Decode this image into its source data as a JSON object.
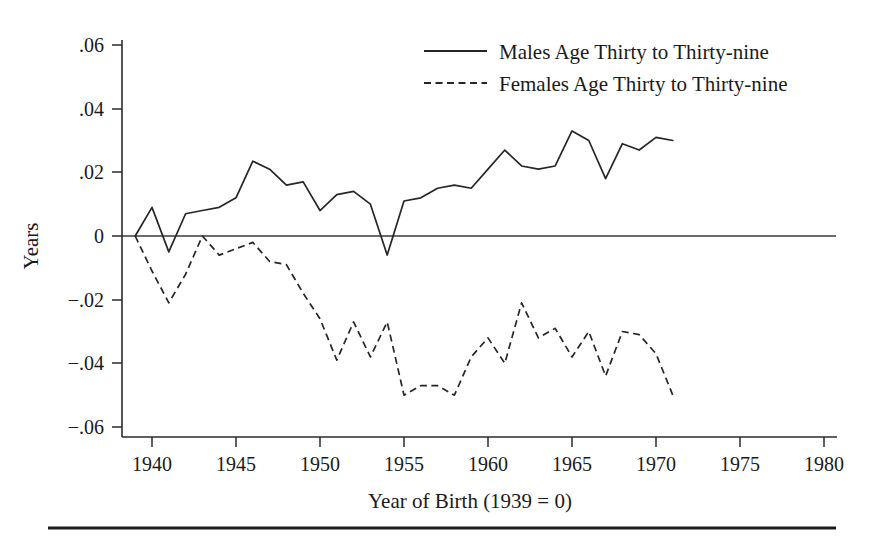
{
  "chart_data": {
    "type": "line",
    "title": "",
    "xlabel": "Year of Birth (1939 = 0)",
    "ylabel": "Years",
    "xlim": [
      1938.2,
      1981.0
    ],
    "ylim": [
      -0.06,
      0.06
    ],
    "xticks": [
      1940,
      1945,
      1950,
      1955,
      1960,
      1965,
      1970,
      1975,
      1980
    ],
    "xtick_labels": [
      "1940",
      "1945",
      "1950",
      "1955",
      "1960",
      "1965",
      "1970",
      "1975",
      "1980"
    ],
    "yticks": [
      0.06,
      0.04,
      0.02,
      0,
      -0.02,
      -0.04,
      -0.06
    ],
    "ytick_labels": [
      ".06",
      ".04",
      ".02",
      "0",
      "−.02",
      "−.04",
      "−.06"
    ],
    "grid": false,
    "legend_position": "top-center",
    "zero_reference_line": true,
    "series": [
      {
        "name": "Males Age Thirty to Thirty-nine",
        "style": "solid",
        "x": [
          1939,
          1940,
          1941,
          1942,
          1943,
          1944,
          1945,
          1946,
          1947,
          1948,
          1949,
          1950,
          1951,
          1952,
          1953,
          1954,
          1955,
          1956,
          1957,
          1958,
          1959,
          1960,
          1961,
          1962,
          1963,
          1964,
          1965,
          1966,
          1967,
          1968,
          1969,
          1970,
          1971
        ],
        "values": [
          0.0,
          0.009,
          -0.005,
          0.007,
          0.008,
          0.009,
          0.012,
          0.0235,
          0.021,
          0.016,
          0.017,
          0.008,
          0.013,
          0.014,
          0.01,
          -0.006,
          0.011,
          0.012,
          0.015,
          0.016,
          0.015,
          0.021,
          0.027,
          0.022,
          0.021,
          0.022,
          0.033,
          0.03,
          0.018,
          0.029,
          0.027,
          0.031,
          0.03
        ]
      },
      {
        "name": "Females Age Thirty to Thirty-nine",
        "style": "dashed",
        "x": [
          1939,
          1940,
          1941,
          1942,
          1943,
          1944,
          1945,
          1946,
          1947,
          1948,
          1949,
          1950,
          1951,
          1952,
          1953,
          1954,
          1955,
          1956,
          1957,
          1958,
          1959,
          1960,
          1961,
          1962,
          1963,
          1964,
          1965,
          1966,
          1967,
          1968,
          1969,
          1970,
          1971
        ],
        "values": [
          0.0,
          -0.011,
          -0.021,
          -0.012,
          0.0,
          -0.006,
          -0.004,
          -0.002,
          -0.008,
          -0.009,
          -0.018,
          -0.026,
          -0.039,
          -0.027,
          -0.038,
          -0.027,
          -0.05,
          -0.047,
          -0.047,
          -0.05,
          -0.038,
          -0.032,
          -0.04,
          -0.021,
          -0.032,
          -0.029,
          -0.038,
          -0.03,
          -0.044,
          -0.03,
          -0.031,
          -0.037,
          -0.05
        ]
      }
    ]
  },
  "legend": {
    "entries": [
      {
        "label": "Males Age Thirty to Thirty-nine",
        "style": "solid"
      },
      {
        "label": "Females Age Thirty to Thirty-nine",
        "style": "dashed"
      }
    ]
  },
  "axes": {
    "y_title": "Years",
    "x_title": "Year of Birth (1939 = 0)",
    "y_labels": [
      ".06",
      ".04",
      ".02",
      "0",
      "−.02",
      "−.04",
      "−.06"
    ],
    "x_labels": [
      "1940",
      "1945",
      "1950",
      "1955",
      "1960",
      "1965",
      "1970",
      "1975",
      "1980"
    ]
  },
  "colors": {
    "ink": "#262626",
    "background": "#ffffff"
  }
}
